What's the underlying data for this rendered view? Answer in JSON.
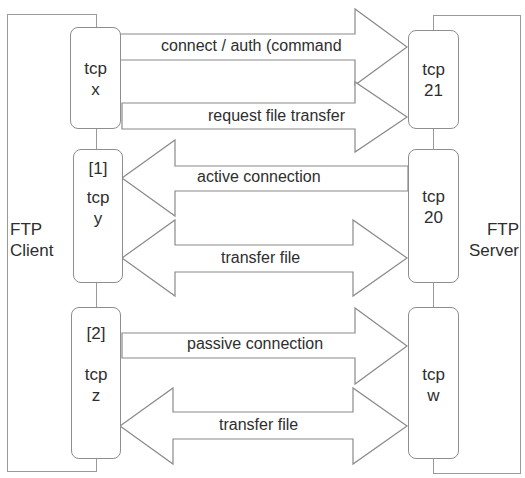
{
  "diagram": {
    "client": {
      "label_line1": "FTP",
      "label_line2": "Client"
    },
    "server": {
      "label_line1": "FTP",
      "label_line2": "Server"
    },
    "client_ports": [
      {
        "tag": "",
        "line1": "tcp",
        "line2": "x"
      },
      {
        "tag": "[1]",
        "line1": "tcp",
        "line2": "y"
      },
      {
        "tag": "[2]",
        "line1": "tcp",
        "line2": "z"
      }
    ],
    "server_ports": [
      {
        "line1": "tcp",
        "line2": "21"
      },
      {
        "line1": "tcp",
        "line2": "20"
      },
      {
        "line1": "tcp",
        "line2": "w"
      }
    ],
    "arrows": [
      {
        "label": "connect / auth (command",
        "label_clipped_line2": "channel)",
        "direction": "client-to-server"
      },
      {
        "label": "request file transfer",
        "direction": "client-to-server"
      },
      {
        "label": "active connection",
        "direction": "server-to-client"
      },
      {
        "label": "transfer file",
        "direction": "bidirectional"
      },
      {
        "label": "passive connection",
        "direction": "client-to-server"
      },
      {
        "label": "transfer file",
        "direction": "bidirectional"
      }
    ],
    "colors": {
      "stroke": "#8a8a8a",
      "fill": "#ffffff",
      "text": "#2e2e2e"
    }
  }
}
